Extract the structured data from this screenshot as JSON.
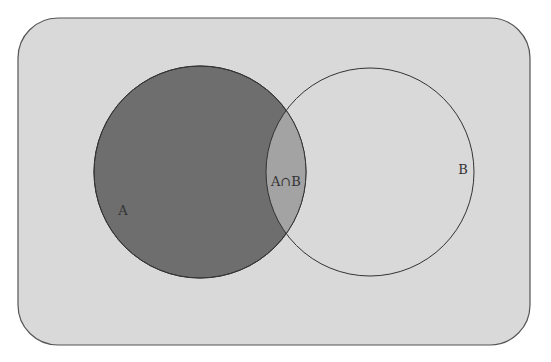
{
  "diagram": {
    "type": "venn",
    "universe": {
      "x": 18,
      "y": 18,
      "width": 512,
      "height": 327,
      "radius": 40,
      "fill": "#d9d9d9",
      "stroke": "#555555"
    },
    "sets": [
      {
        "id": "A",
        "label": "A",
        "cx": 200,
        "cy": 172,
        "r": 106,
        "fill": "#6e6e6e",
        "label_x": 123,
        "label_y": 215
      },
      {
        "id": "B",
        "label": "B",
        "cx": 370,
        "cy": 172,
        "r": 104,
        "fill": "none",
        "label_x": 463,
        "label_y": 174
      }
    ],
    "intersection": {
      "label": "A∩B",
      "fill": "#a3a3a3",
      "label_x": 286,
      "label_y": 186
    }
  }
}
